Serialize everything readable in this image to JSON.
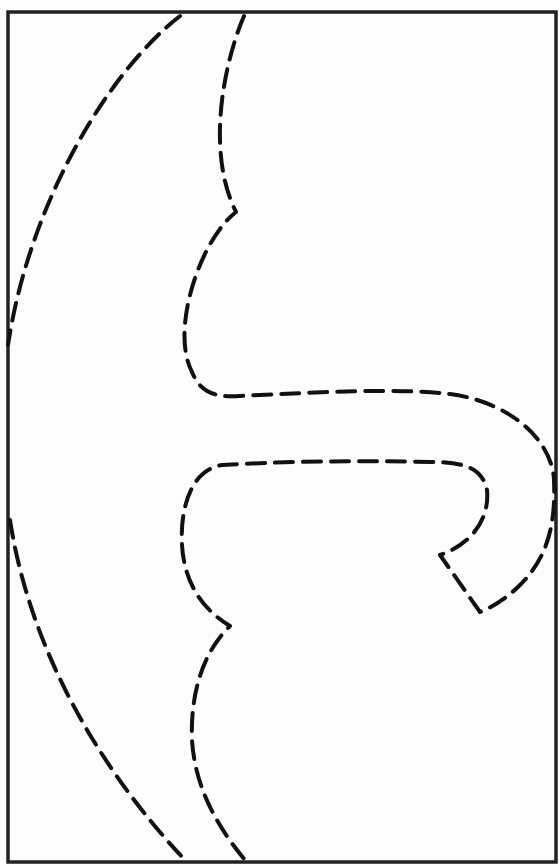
{
  "template": {
    "kind": "printable cut-out pattern",
    "border_color": "#222222",
    "line_color": "#111111",
    "line_style": "dashed",
    "background": "#fdfdfd"
  },
  "shapes": {
    "outer_arc": "left curved cut line",
    "inner_outline": "inner dashed outline with two notches and hooked right end"
  }
}
